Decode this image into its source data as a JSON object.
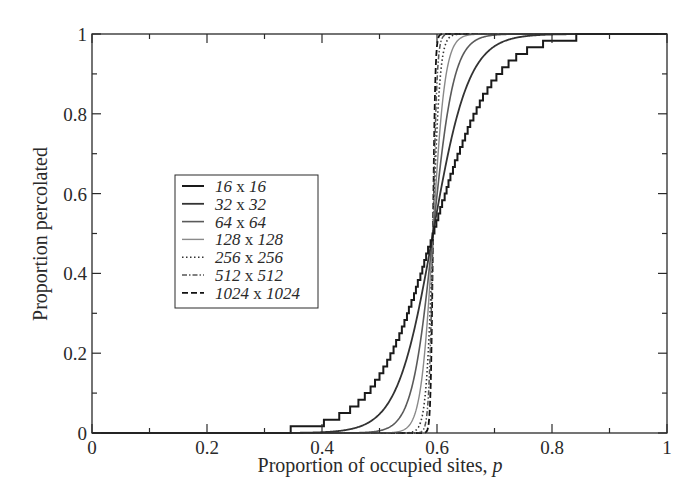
{
  "chart_data": {
    "type": "line",
    "title": "",
    "xlabel": "Proportion of occupied sites, ",
    "xlabel_italic": "p",
    "ylabel": "Proportion percolated",
    "xlim": [
      0,
      1
    ],
    "ylim": [
      0,
      1
    ],
    "x_ticks": [
      0,
      0.2,
      0.4,
      0.6,
      0.8,
      1
    ],
    "x_tick_labels": [
      "0",
      "0.2",
      "0.4",
      "0.6",
      "0.8",
      "1"
    ],
    "x_minor_ticks": [
      0.1,
      0.3,
      0.5,
      0.7,
      0.9
    ],
    "y_ticks": [
      0,
      0.2,
      0.4,
      0.6,
      0.8,
      1
    ],
    "y_tick_labels": [
      "0",
      "0.2",
      "0.4",
      "0.6",
      "0.8",
      "1"
    ],
    "y_minor_ticks": [
      0.1,
      0.3,
      0.5,
      0.7,
      0.9
    ],
    "grid": false,
    "legend_position": "center-left inside plot",
    "critical_point_approx": 0.593,
    "series": [
      {
        "name": "16 x 16",
        "a": "16",
        "b": "16",
        "style": "solid",
        "color": "#1a1a1a",
        "width": 2.0,
        "steps": true,
        "pc": 0.593,
        "w": 0.052
      },
      {
        "name": "32 x 32",
        "a": "32",
        "b": "32",
        "style": "solid",
        "color": "#333333",
        "width": 1.8,
        "steps": false,
        "pc": 0.593,
        "w": 0.031
      },
      {
        "name": "64 x 64",
        "a": "64",
        "b": "64",
        "style": "solid",
        "color": "#5a5a5a",
        "width": 1.6,
        "steps": false,
        "pc": 0.593,
        "w": 0.018
      },
      {
        "name": "128 x 128",
        "a": "128",
        "b": "128",
        "style": "solid",
        "color": "#8a8a8a",
        "width": 1.4,
        "steps": false,
        "pc": 0.593,
        "w": 0.0105
      },
      {
        "name": "256 x 256",
        "a": "256",
        "b": "256",
        "style": "dotted",
        "color": "#333333",
        "width": 1.6,
        "steps": false,
        "pc": 0.593,
        "w": 0.006
      },
      {
        "name": "512 x 512",
        "a": "512",
        "b": "512",
        "style": "dashdot",
        "color": "#555555",
        "width": 1.5,
        "steps": false,
        "pc": 0.593,
        "w": 0.0035
      },
      {
        "name": "1024 x 1024",
        "a": "1024",
        "b": "1024",
        "style": "dashed",
        "color": "#111111",
        "width": 1.8,
        "steps": false,
        "pc": 0.593,
        "w": 0.002
      }
    ],
    "approx_points": {
      "x": [
        0.4,
        0.45,
        0.5,
        0.53,
        0.56,
        0.58,
        0.593,
        0.61,
        0.63,
        0.66,
        0.7,
        0.75,
        0.8
      ],
      "16 x 16": [
        0.0,
        0.01,
        0.06,
        0.14,
        0.28,
        0.42,
        0.5,
        0.63,
        0.76,
        0.89,
        0.97,
        0.995,
        1.0
      ],
      "32 x 32": [
        0.0,
        0.0,
        0.02,
        0.06,
        0.18,
        0.36,
        0.5,
        0.72,
        0.88,
        0.97,
        1.0,
        1.0,
        1.0
      ],
      "64 x 64": [
        0.0,
        0.0,
        0.0,
        0.01,
        0.08,
        0.3,
        0.5,
        0.84,
        0.97,
        1.0,
        1.0,
        1.0,
        1.0
      ],
      "128 x 128": [
        0.0,
        0.0,
        0.0,
        0.0,
        0.02,
        0.22,
        0.5,
        0.94,
        1.0,
        1.0,
        1.0,
        1.0,
        1.0
      ],
      "256 x 256": [
        0.0,
        0.0,
        0.0,
        0.0,
        0.0,
        0.1,
        0.5,
        0.99,
        1.0,
        1.0,
        1.0,
        1.0,
        1.0
      ],
      "512 x 512": [
        0.0,
        0.0,
        0.0,
        0.0,
        0.0,
        0.02,
        0.5,
        1.0,
        1.0,
        1.0,
        1.0,
        1.0,
        1.0
      ],
      "1024 x 1024": [
        0.0,
        0.0,
        0.0,
        0.0,
        0.0,
        0.0,
        0.5,
        1.0,
        1.0,
        1.0,
        1.0,
        1.0,
        1.0
      ]
    }
  },
  "legend": {
    "times_label": "x",
    "entries": [
      {
        "a": "16",
        "b": "16"
      },
      {
        "a": "32",
        "b": "32"
      },
      {
        "a": "64",
        "b": "64"
      },
      {
        "a": "128",
        "b": "128"
      },
      {
        "a": "256",
        "b": "256"
      },
      {
        "a": "512",
        "b": "512"
      },
      {
        "a": "1024",
        "b": "1024"
      }
    ]
  },
  "colors": {
    "axis": "#2a2a2a",
    "background": "#ffffff"
  }
}
